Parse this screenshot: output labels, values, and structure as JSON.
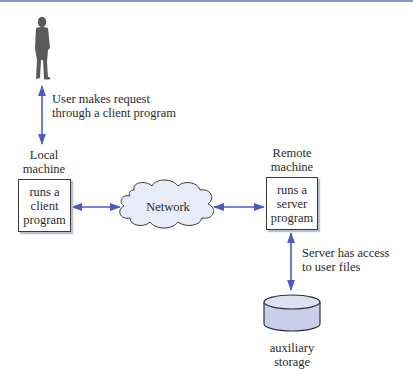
{
  "diagram": {
    "type": "client-server network diagram",
    "colors": {
      "arrow": "#4a5cc4",
      "cloud_fill": "#e8ecf8",
      "storage_fill": "#c9cfea",
      "box_shadow": "#b9bfd8",
      "top_bar": "#8a94c4",
      "person": "#5a5a5a"
    },
    "nodes": {
      "user": {
        "icon": "person-icon"
      },
      "local_machine": {
        "caption": "Local\nmachine",
        "box_text": "runs a\nclient\nprogram"
      },
      "network": {
        "label": "Network",
        "icon": "cloud-icon"
      },
      "remote_machine": {
        "caption": "Remote\nmachine",
        "box_text": "runs a\nserver\nprogram"
      },
      "storage": {
        "label": "auxiliary\nstorage",
        "icon": "database-cylinder-icon"
      }
    },
    "edges": [
      {
        "from": "user",
        "to": "local_machine",
        "label": "User makes request\nthrough a client program",
        "direction": "bidirectional"
      },
      {
        "from": "local_machine",
        "to": "network",
        "label": "",
        "direction": "bidirectional"
      },
      {
        "from": "network",
        "to": "remote_machine",
        "label": "",
        "direction": "bidirectional"
      },
      {
        "from": "remote_machine",
        "to": "storage",
        "label": "Server has access\nto user files",
        "direction": "bidirectional"
      }
    ]
  }
}
